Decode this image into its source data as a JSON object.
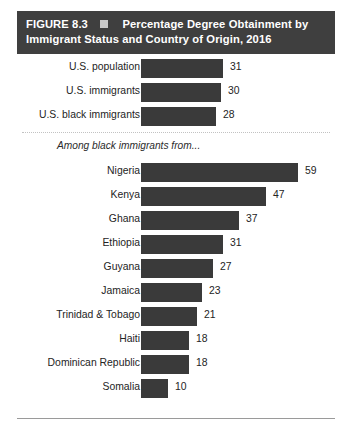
{
  "header": {
    "figure_number": "FIGURE 8.3",
    "marker_icon": "square-bullet-icon",
    "title_line_1": "Percentage Degree Obtainment by",
    "title_line_2": "Immigrant Status and Country of Origin, 2016",
    "background_color": "#3f3f3f",
    "text_color": "#ffffff"
  },
  "section_note": "Among black immigrants from...",
  "chart_data": {
    "type": "bar",
    "orientation": "horizontal",
    "title": "FIGURE 8.3  Percentage Degree Obtainment by Immigrant Status and Country of Origin, 2016",
    "xlabel": "",
    "ylabel": "",
    "xlim": [
      0,
      59
    ],
    "grid": false,
    "legend": null,
    "bar_color": "#3a3a3a",
    "value_label_position": "outside-end",
    "groups": [
      {
        "name": "overall",
        "note": null,
        "categories": [
          "U.S. population",
          "U.S. immigrants",
          "U.S. black immigrants"
        ],
        "values": [
          31,
          30,
          28
        ]
      },
      {
        "name": "black-immigrant-origin",
        "note": "Among black immigrants from...",
        "categories": [
          "Nigeria",
          "Kenya",
          "Ghana",
          "Ethiopia",
          "Guyana",
          "Jamaica",
          "Trinidad & Tobago",
          "Haiti",
          "Dominican Republic",
          "Somalia"
        ],
        "values": [
          59,
          47,
          37,
          31,
          27,
          23,
          21,
          18,
          18,
          10
        ]
      }
    ],
    "categories": [
      "U.S. population",
      "U.S. immigrants",
      "U.S. black immigrants",
      "Nigeria",
      "Kenya",
      "Ghana",
      "Ethiopia",
      "Guyana",
      "Jamaica",
      "Trinidad & Tobago",
      "Haiti",
      "Dominican Republic",
      "Somalia"
    ],
    "values": [
      31,
      30,
      28,
      59,
      47,
      37,
      31,
      27,
      23,
      21,
      18,
      18,
      10
    ]
  }
}
